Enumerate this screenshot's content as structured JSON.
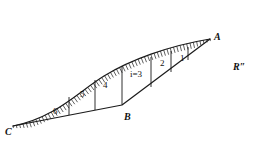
{
  "figure": {
    "background_color": "#ffffff",
    "stroke_color": "#1a1a1a",
    "point_labels": [
      {
        "name": "A",
        "text": "A",
        "x": 214,
        "y": 32
      },
      {
        "name": "B",
        "text": "B",
        "x": 124,
        "y": 112
      },
      {
        "name": "C",
        "text": "C",
        "x": 5,
        "y": 127
      }
    ],
    "region_label": {
      "text": "R″",
      "x": 233,
      "y": 62
    },
    "strip_labels": [
      {
        "id": "strip-1",
        "text": "1",
        "x": 180,
        "y": 54
      },
      {
        "id": "strip-2",
        "text": "2",
        "x": 160,
        "y": 59
      },
      {
        "id": "strip-3",
        "text": "i=3",
        "x": 130,
        "y": 70
      },
      {
        "id": "strip-4",
        "text": "4",
        "x": 103,
        "y": 81
      },
      {
        "id": "strip-5",
        "text": "5",
        "x": 80,
        "y": 90
      },
      {
        "id": "strip-6",
        "text": "6",
        "x": 53,
        "y": 107
      }
    ],
    "geometry": {
      "point_A": [
        210,
        39
      ],
      "point_B": [
        122,
        105
      ],
      "point_C": [
        13,
        126
      ],
      "upper_curve": "M 13 126 C 55 118, 78 92, 104 76 C 130 60, 168 46, 210 39",
      "lower_path": "M 13 126 L 122 105 L 210 39",
      "dividers": [
        {
          "id": "divider-1",
          "x1": 188,
          "y1": 47,
          "x2": 188,
          "y2": 60
        },
        {
          "id": "divider-2",
          "x1": 171,
          "y1": 51,
          "x2": 171,
          "y2": 72
        },
        {
          "id": "divider-3",
          "x1": 151,
          "y1": 57,
          "x2": 151,
          "y2": 87
        },
        {
          "id": "divider-4",
          "x1": 122,
          "y1": 66,
          "x2": 122,
          "y2": 105
        },
        {
          "id": "divider-5",
          "x1": 95,
          "y1": 80,
          "x2": 95,
          "y2": 110
        },
        {
          "id": "divider-6",
          "x1": 69,
          "y1": 97,
          "x2": 69,
          "y2": 115
        }
      ],
      "hatch_count": 64,
      "hatch_length": 6
    }
  }
}
